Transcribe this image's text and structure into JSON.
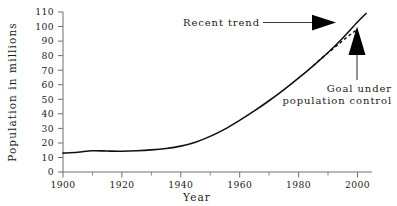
{
  "chart_data": {
    "type": "line",
    "title": "",
    "xlabel": "Year",
    "ylabel": "Population in millions",
    "xlim": [
      1900,
      2005
    ],
    "ylim": [
      0,
      110
    ],
    "grid": false,
    "legend": "none",
    "xticks": [
      1900,
      1920,
      1940,
      1960,
      1980,
      2000
    ],
    "xticks_minor": [
      1910,
      1930,
      1950,
      1970,
      1990
    ],
    "yticks": [
      0,
      10,
      20,
      30,
      40,
      50,
      60,
      70,
      80,
      90,
      100,
      110
    ],
    "series": [
      {
        "name": "Recent trend",
        "style": "solid",
        "x": [
          1900,
          1905,
          1910,
          1915,
          1920,
          1925,
          1930,
          1935,
          1940,
          1945,
          1950,
          1955,
          1960,
          1965,
          1970,
          1975,
          1980,
          1985,
          1990,
          1995,
          2000,
          2003
        ],
        "values": [
          13,
          13.6,
          14.6,
          14.4,
          14.3,
          14.6,
          15.2,
          16.2,
          17.8,
          20.5,
          24.5,
          29.5,
          35.5,
          42,
          49,
          56.5,
          64.5,
          73,
          82,
          92,
          103,
          109
        ]
      },
      {
        "name": "Goal under population control",
        "style": "dashed",
        "x": [
          1985,
          1988,
          1991,
          1994,
          1997,
          2000
        ],
        "values": [
          73,
          78.5,
          83.5,
          88.5,
          93.5,
          98
        ]
      }
    ],
    "annotations": [
      {
        "name": "recent-trend",
        "text": "Recent trend",
        "arrow": "right",
        "target_x": 1997,
        "target_y": 104
      },
      {
        "name": "goal-under-population-control",
        "text_line1": "Goal under",
        "text_line2": "population control",
        "arrow": "up",
        "target_x": 1999,
        "target_y": 96
      }
    ],
    "colors": {
      "line": "#111111",
      "axis": "#6f6f6f",
      "text": "#1a1a1a",
      "background": "#ffffff"
    }
  }
}
